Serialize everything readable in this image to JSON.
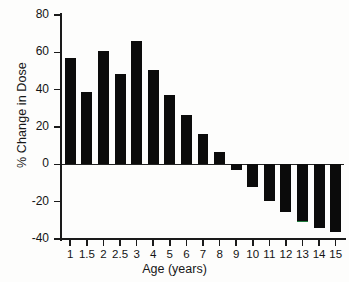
{
  "chart_data": {
    "type": "bar",
    "title": "",
    "xlabel": "Age (years)",
    "ylabel": "% Change in Dose",
    "categories": [
      "1",
      "1.5",
      "2",
      "2.5",
      "3",
      "4",
      "5",
      "6",
      "7",
      "8",
      "9",
      "10",
      "11",
      "12",
      "13",
      "14",
      "15"
    ],
    "values": [
      57,
      39,
      60.5,
      48.5,
      66,
      50.5,
      37,
      26.5,
      16,
      6.5,
      -3,
      -12,
      -19.5,
      -25.5,
      -30.5,
      -34,
      -36
    ],
    "ylim": [
      -40,
      80
    ],
    "yticks": [
      80,
      60,
      40,
      20,
      0,
      -20,
      -40
    ],
    "ytick_labels": [
      "80",
      "60",
      "40",
      "20",
      "0",
      "-20",
      "-40"
    ],
    "grid": false,
    "legend": "none",
    "bar_color": "#0b0b0b",
    "accent_color": "#1e7a3c",
    "annotations": [
      {
        "category": "13",
        "note": "green underline at bar base"
      }
    ]
  },
  "axes": {
    "y_title": "% Change in Dose",
    "x_title": "Age (years)"
  }
}
